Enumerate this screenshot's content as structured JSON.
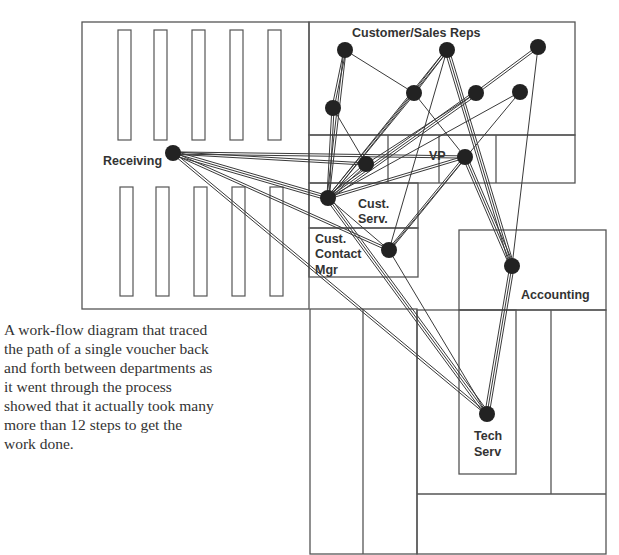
{
  "caption": "A work-flow diagram that traced the path of a single voucher back and forth between departments as it went through the process showed that it actually took many more than 12 steps to get the work done.",
  "labels": {
    "customer_sales_reps": "Customer/Sales Reps",
    "receiving": "Receiving",
    "vp": "VP",
    "cust_serv_1": "Cust.",
    "cust_serv_2": "Serv.",
    "ccm_1": "Cust.",
    "ccm_2": "Contact",
    "ccm_3": "Mgr",
    "accounting": "Accounting",
    "tech_1": "Tech",
    "tech_2": "Serv"
  },
  "colors": {
    "wall": "#555555",
    "edge": "#3a3a3a",
    "node": "#222222",
    "text": "#333333"
  },
  "nodes": [
    {
      "id": "rep1",
      "x": 345,
      "y": 50
    },
    {
      "id": "rep2",
      "x": 447,
      "y": 50
    },
    {
      "id": "rep3",
      "x": 538,
      "y": 47
    },
    {
      "id": "rep4",
      "x": 333,
      "y": 108
    },
    {
      "id": "rep5",
      "x": 414,
      "y": 93
    },
    {
      "id": "rep6",
      "x": 476,
      "y": 93
    },
    {
      "id": "rep7",
      "x": 520,
      "y": 92
    },
    {
      "id": "office",
      "x": 366,
      "y": 164
    },
    {
      "id": "vp",
      "x": 465,
      "y": 157
    },
    {
      "id": "receiving",
      "x": 173,
      "y": 153
    },
    {
      "id": "custserv",
      "x": 328,
      "y": 198
    },
    {
      "id": "ccm",
      "x": 389,
      "y": 250
    },
    {
      "id": "accounting",
      "x": 512,
      "y": 266
    },
    {
      "id": "techserv",
      "x": 487,
      "y": 414
    }
  ],
  "edges": [
    [
      "rep1",
      "rep4",
      2
    ],
    [
      "rep1",
      "rep5",
      1
    ],
    [
      "rep1",
      "custserv",
      2
    ],
    [
      "rep2",
      "rep5",
      2
    ],
    [
      "rep2",
      "custserv",
      2
    ],
    [
      "rep2",
      "ccm",
      1
    ],
    [
      "rep2",
      "accounting",
      3
    ],
    [
      "rep3",
      "rep6",
      2
    ],
    [
      "rep3",
      "accounting",
      1
    ],
    [
      "rep4",
      "office",
      1
    ],
    [
      "rep4",
      "custserv",
      2
    ],
    [
      "rep5",
      "custserv",
      2
    ],
    [
      "rep5",
      "vp",
      1
    ],
    [
      "rep6",
      "custserv",
      3
    ],
    [
      "rep6",
      "office",
      1
    ],
    [
      "rep7",
      "custserv",
      1
    ],
    [
      "rep7",
      "ccm",
      1
    ],
    [
      "office",
      "custserv",
      2
    ],
    [
      "receiving",
      "office",
      2
    ],
    [
      "receiving",
      "vp",
      2
    ],
    [
      "receiving",
      "custserv",
      3
    ],
    [
      "receiving",
      "ccm",
      2
    ],
    [
      "receiving",
      "techserv",
      2
    ],
    [
      "vp",
      "custserv",
      2
    ],
    [
      "vp",
      "ccm",
      2
    ],
    [
      "vp",
      "accounting",
      3
    ],
    [
      "custserv",
      "ccm",
      1
    ],
    [
      "custserv",
      "techserv",
      3
    ],
    [
      "ccm",
      "techserv",
      1
    ],
    [
      "accounting",
      "techserv",
      3
    ]
  ]
}
